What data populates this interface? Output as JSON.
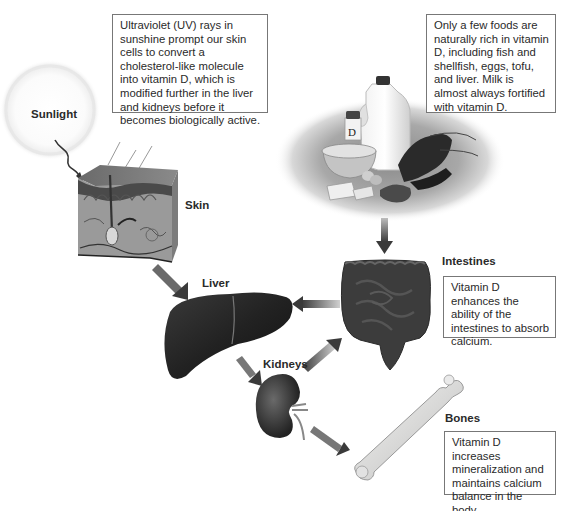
{
  "diagram": {
    "nodes": [
      {
        "id": "sunlight",
        "label": "Sunlight"
      },
      {
        "id": "skin",
        "label": "Skin"
      },
      {
        "id": "foods",
        "label": ""
      },
      {
        "id": "liver",
        "label": "Liver"
      },
      {
        "id": "intestines",
        "label": "Intestines"
      },
      {
        "id": "kidneys",
        "label": "Kidneys"
      },
      {
        "id": "bones",
        "label": "Bones"
      }
    ],
    "edges": [
      {
        "from": "sunlight",
        "to": "skin"
      },
      {
        "from": "skin",
        "to": "liver"
      },
      {
        "from": "foods",
        "to": "intestines"
      },
      {
        "from": "intestines",
        "to": "liver"
      },
      {
        "from": "liver",
        "to": "kidneys"
      },
      {
        "from": "kidneys",
        "to": "intestines"
      },
      {
        "from": "kidneys",
        "to": "bones"
      }
    ]
  },
  "labels": {
    "sunlight": "Sunlight",
    "skin": "Skin",
    "liver": "Liver",
    "kidneys": "Kidneys",
    "intestines": "Intestines",
    "bones": "Bones"
  },
  "callouts": {
    "skin_uv": "Ultraviolet (UV) rays in sunshine prompt our skin cells to convert a cholesterol-like molecule into vitamin D, which is modified further in the liver and kidneys before it becomes biologically active.",
    "foods": "Only a few foods are naturally rich in vitamin D, including fish and shellfish, eggs, tofu, and liver. Milk is almost always fortified with vitamin D.",
    "intestines": "Vitamin D enhances the ability of the intestines to absorb calcium.",
    "bones": "Vitamin D increases mineralization and maintains calcium balance in the body."
  },
  "food_items": {
    "supplement_label": "D"
  },
  "colors": {
    "arrow": "#555555",
    "organ_dark": "#2e2e2e",
    "box_border": "#777777",
    "sun_glow": "#f2f2f2"
  }
}
